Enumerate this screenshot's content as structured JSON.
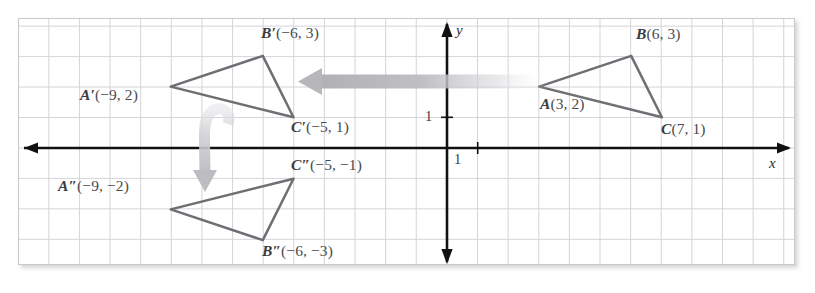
{
  "figure": {
    "type": "coordinate-geometry-diagram",
    "axes": {
      "x_label": "x",
      "y_label": "y",
      "x_tick_label": "1",
      "y_tick_label": "1",
      "grid_spacing_units": 1,
      "x_range": [
        -14,
        11
      ],
      "y_range": [
        -4,
        4
      ],
      "axis_color": "#111114",
      "grid_color": "#d5d5da"
    },
    "triangles": [
      {
        "name": "ABC",
        "stroke": "#6e6e73",
        "vertices": [
          {
            "name": "A",
            "label_name": "A",
            "coords": "(3, 2)",
            "x": 3,
            "y": 2,
            "label": "A(3, 2)"
          },
          {
            "name": "B",
            "label_name": "B",
            "coords": "(6, 3)",
            "x": 6,
            "y": 3,
            "label": "B(6, 3)"
          },
          {
            "name": "C",
            "label_name": "C",
            "coords": "(7, 1)",
            "x": 7,
            "y": 1,
            "label": "C(7, 1)"
          }
        ]
      },
      {
        "name": "A'B'C'",
        "stroke": "#6e6e73",
        "vertices": [
          {
            "name": "A'",
            "label_name": "A′",
            "coords": "(−9, 2)",
            "x": -9,
            "y": 2,
            "label": "A′(−9, 2)"
          },
          {
            "name": "B'",
            "label_name": "B′",
            "coords": "(−6, 3)",
            "x": -6,
            "y": 3,
            "label": "B′(−6, 3)"
          },
          {
            "name": "C'",
            "label_name": "C′",
            "coords": "(−5, 1)",
            "x": -5,
            "y": 1,
            "label": "C′(−5, 1)"
          }
        ]
      },
      {
        "name": "A''B''C''",
        "stroke": "#6e6e73",
        "vertices": [
          {
            "name": "A''",
            "label_name": "A″",
            "coords": "(−9, −2)",
            "x": -9,
            "y": -2,
            "label": "A″(−9, −2)"
          },
          {
            "name": "B''",
            "label_name": "B″",
            "coords": "(−6, −3)",
            "x": -6,
            "y": -3,
            "label": "B″(−6, −3)"
          },
          {
            "name": "C''",
            "label_name": "C″",
            "coords": "(−5, −1)",
            "x": -5,
            "y": -1,
            "label": "C″(−5, −1)"
          }
        ]
      }
    ],
    "arrows": [
      {
        "name": "translation-arrow",
        "direction": "left",
        "color": "#b9b9be"
      },
      {
        "name": "reflection-arrow",
        "direction": "down-curved",
        "color": "#bebec3"
      }
    ]
  }
}
